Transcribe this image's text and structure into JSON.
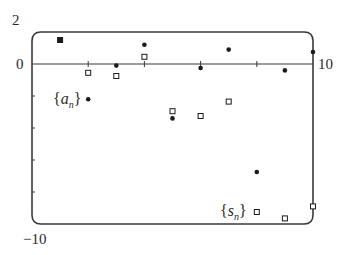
{
  "chart_data": {
    "type": "scatter",
    "title": "",
    "xlabel": "",
    "ylabel": "",
    "xlim": [
      0,
      10
    ],
    "ylim": [
      -10,
      2
    ],
    "x_tick_labels": [
      "0",
      "10"
    ],
    "y_tick_labels": [
      "2",
      "0",
      "-10"
    ],
    "x_ticks": [
      2,
      4,
      6,
      8
    ],
    "y_ticks": [
      -2,
      -4,
      -6,
      -8
    ],
    "grid": false,
    "x": [
      1,
      2,
      3,
      4,
      5,
      6,
      7,
      8,
      9,
      10
    ],
    "series": [
      {
        "name": "{a_n}",
        "label_base": "{a",
        "label_sub": "n",
        "label_end": "}",
        "marker": "filled-circle",
        "values": [
          1.5,
          -2.2,
          -0.1,
          1.2,
          -3.4,
          -0.25,
          0.9,
          -6.75,
          -0.4,
          0.75
        ]
      },
      {
        "name": "{s_n}",
        "label_base": "{s",
        "label_sub": "n",
        "label_end": "}",
        "marker": "open-square",
        "values": [
          1.5,
          -0.55,
          -0.75,
          0.45,
          -2.95,
          -3.25,
          -2.35,
          -9.25,
          -9.65,
          -8.9
        ]
      }
    ],
    "legend_position": "inline labels near points"
  },
  "labels": {
    "y_top": "2",
    "y_zero": "0",
    "y_bottom": "−10",
    "x_right": "10"
  },
  "series_labels": {
    "a": {
      "open": "{",
      "base": "a",
      "sub": "n",
      "close": "}"
    },
    "s": {
      "open": "{",
      "base": "s",
      "sub": "n",
      "close": "}"
    }
  },
  "colors": {
    "frame": "#3a3a3a",
    "points": "#1a1a1a",
    "text": "#2a2a2a"
  }
}
